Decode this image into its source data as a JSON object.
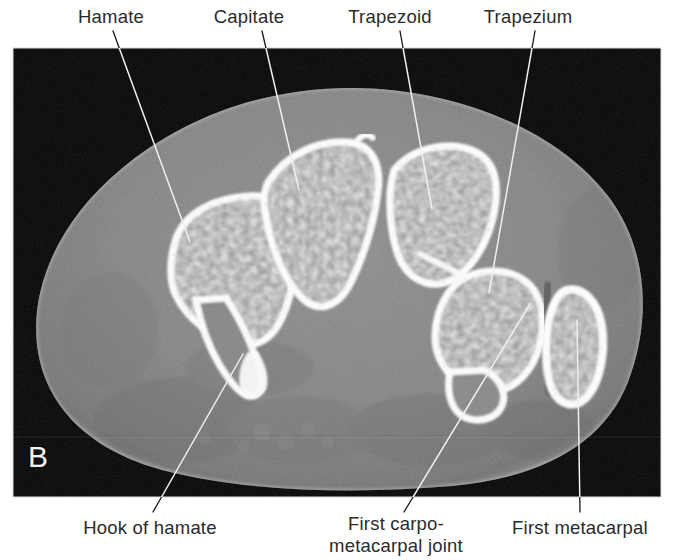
{
  "figure": {
    "panel_letter": "B",
    "modality": "ct-axial-wrist",
    "image_frame": {
      "x": 13,
      "y": 48,
      "width": 648,
      "height": 449
    },
    "background_color": "#ffffff",
    "image_background_color": "#050505",
    "leader_line_color_on_white": "#1a1a1a",
    "leader_line_color_on_image": "#f0f0f0"
  },
  "labels": {
    "top": [
      {
        "id": "hamate",
        "text": "Hamate",
        "text_x": 111,
        "text_y": 24,
        "leader": {
          "x1": 113,
          "y1": 31,
          "x2": 190,
          "y2": 242
        }
      },
      {
        "id": "capitate",
        "text": "Capitate",
        "text_x": 249,
        "text_y": 24,
        "leader": {
          "x1": 262,
          "y1": 31,
          "x2": 299,
          "y2": 190
        }
      },
      {
        "id": "trapezoid",
        "text": "Trapezoid",
        "text_x": 390,
        "text_y": 24,
        "leader": {
          "x1": 400,
          "y1": 31,
          "x2": 432,
          "y2": 209
        }
      },
      {
        "id": "trapezium",
        "text": "Trapezium",
        "text_x": 528,
        "text_y": 24,
        "leader": {
          "x1": 535,
          "y1": 31,
          "x2": 489,
          "y2": 293
        }
      }
    ],
    "bottom": [
      {
        "id": "hook-of-hamate",
        "lines": [
          "Hook of hamate"
        ],
        "text_x": 150,
        "text_y": 530,
        "leader": {
          "x1": 153,
          "y1": 512,
          "x2": 243,
          "y2": 354
        }
      },
      {
        "id": "first-carpometacarpal-joint",
        "lines": [
          "First carpo-",
          "metacarpal joint"
        ],
        "text_x": 396,
        "text_y": 530,
        "leader": {
          "x1": 404,
          "y1": 512,
          "x2": 530,
          "y2": 304
        }
      },
      {
        "id": "first-metacarpal",
        "lines": [
          "First metacarpal"
        ],
        "text_x": 580,
        "text_y": 530,
        "leader": {
          "x1": 580,
          "y1": 512,
          "x2": 577,
          "y2": 320
        }
      }
    ]
  },
  "anatomy": {
    "bones": [
      {
        "name": "hamate",
        "label_id": "hamate"
      },
      {
        "name": "capitate",
        "label_id": "capitate"
      },
      {
        "name": "trapezoid",
        "label_id": "trapezoid"
      },
      {
        "name": "trapezium",
        "label_id": "trapezium"
      },
      {
        "name": "hook-of-hamate",
        "label_id": "hook-of-hamate"
      },
      {
        "name": "first-metacarpal",
        "label_id": "first-metacarpal"
      }
    ],
    "joints": [
      {
        "name": "first-carpometacarpal-joint",
        "label_id": "first-carpometacarpal-joint"
      }
    ]
  }
}
